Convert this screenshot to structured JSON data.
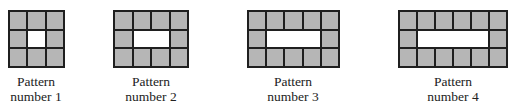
{
  "diagram": {
    "cell_fill": "#b6b6b6",
    "border_color": "#1f1f1f",
    "patterns": [
      {
        "label_line1": "Pattern",
        "label_line2": "number 1",
        "columns": 3,
        "rows": 3,
        "gray_tiles": 8,
        "white_tiles": 1
      },
      {
        "label_line1": "Pattern",
        "label_line2": "number 2",
        "columns": 4,
        "rows": 3,
        "gray_tiles": 10,
        "white_tiles": 2
      },
      {
        "label_line1": "Pattern",
        "label_line2": "number 3",
        "columns": 5,
        "rows": 3,
        "gray_tiles": 12,
        "white_tiles": 3
      },
      {
        "label_line1": "Pattern",
        "label_line2": "number 4",
        "columns": 6,
        "rows": 3,
        "gray_tiles": 14,
        "white_tiles": 4
      }
    ]
  }
}
